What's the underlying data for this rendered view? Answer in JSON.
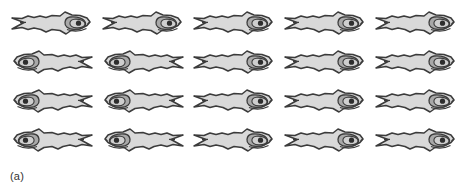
{
  "figure": {
    "caption": "(a)",
    "background_color": "#ffffff",
    "body_fill": "#d9d9d9",
    "outline_color": "#3b3b3b",
    "gill_fill": "#a8a8a8",
    "pupil_fill": "#2e2e2e",
    "rows": 4,
    "columns": 5,
    "total_fish": 20,
    "item_name": "fish-silhouette",
    "grid": [
      [
        {
          "orientation": "right",
          "label": "fish-r1-c1"
        },
        {
          "orientation": "right",
          "label": "fish-r1-c2"
        },
        {
          "orientation": "right",
          "label": "fish-r1-c3"
        },
        {
          "orientation": "right",
          "label": "fish-r1-c4"
        },
        {
          "orientation": "right",
          "label": "fish-r1-c5"
        }
      ],
      [
        {
          "orientation": "left",
          "label": "fish-r2-c1"
        },
        {
          "orientation": "left",
          "label": "fish-r2-c2"
        },
        {
          "orientation": "right",
          "label": "fish-r2-c3"
        },
        {
          "orientation": "right",
          "label": "fish-r2-c4"
        },
        {
          "orientation": "right",
          "label": "fish-r2-c5"
        }
      ],
      [
        {
          "orientation": "left",
          "label": "fish-r3-c1"
        },
        {
          "orientation": "left",
          "label": "fish-r3-c2"
        },
        {
          "orientation": "right",
          "label": "fish-r3-c3"
        },
        {
          "orientation": "right",
          "label": "fish-r3-c4"
        },
        {
          "orientation": "right",
          "label": "fish-r3-c5"
        }
      ],
      [
        {
          "orientation": "left",
          "label": "fish-r4-c1"
        },
        {
          "orientation": "left",
          "label": "fish-r4-c2"
        },
        {
          "orientation": "right",
          "label": "fish-r4-c3"
        },
        {
          "orientation": "right",
          "label": "fish-r4-c4"
        },
        {
          "orientation": "right",
          "label": "fish-r4-c5"
        }
      ]
    ]
  }
}
